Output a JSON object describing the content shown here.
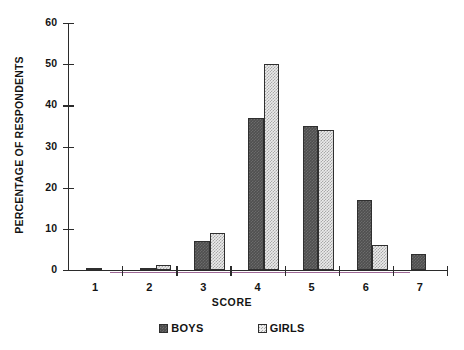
{
  "chart_data": {
    "type": "bar",
    "title": "",
    "xlabel": "SCORE",
    "ylabel": "PERCENTAGE OF RESPONDENTS",
    "categories": [
      "1",
      "2",
      "3",
      "4",
      "5",
      "6",
      "7"
    ],
    "series": [
      {
        "name": "BOYS",
        "values": [
          0.4,
          0.6,
          7,
          37,
          35,
          17,
          4
        ],
        "color": "#4f4f4f",
        "pattern": "dark-checker"
      },
      {
        "name": "GIRLS",
        "values": [
          0,
          1.2,
          9,
          50,
          34,
          6,
          0
        ],
        "color": "#ebebeb",
        "pattern": "light-checker"
      }
    ],
    "ylim": [
      0,
      60
    ],
    "yticks": [
      0,
      10,
      20,
      30,
      40,
      50,
      60
    ],
    "ytick_labels": [
      "0",
      "10",
      "20",
      "30",
      "40",
      "50",
      "60"
    ],
    "xtick_labels": [
      "1",
      "2",
      "3",
      "4",
      "5",
      "6",
      "7"
    ],
    "grid": false,
    "legend_position": "bottom",
    "legend_entries": [
      "BOYS",
      "GIRLS"
    ],
    "axis_color": "#2b2b2b",
    "background": "#ffffff"
  }
}
